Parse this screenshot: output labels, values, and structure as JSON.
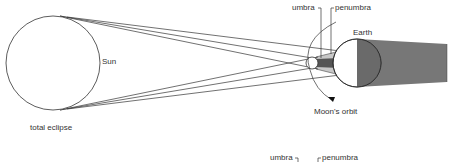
{
  "diagram": {
    "title": "total eclipse",
    "labels": {
      "sun": "Sun",
      "earth": "Earth",
      "umbra": "umbra",
      "penumbra": "penumbra",
      "moon_orbit": "Moon's orbit",
      "caption": "total eclipse",
      "umbra_bottom": "umbra",
      "penumbra_bottom": "penumbra"
    },
    "colors": {
      "line": "#333333",
      "umbra_fill": "#555555",
      "penumbra_fill": "#bbbbbb",
      "earth_shadow": "#777777"
    }
  }
}
